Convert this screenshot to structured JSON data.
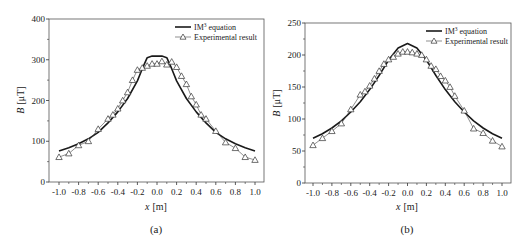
{
  "chart_data": [
    {
      "id": "a",
      "type": "line",
      "caption": "(a)",
      "xlabel": "x [m]",
      "xlabel_var": "x",
      "xlabel_unit": "[m]",
      "ylabel": "B [μT]",
      "ylabel_var": "B",
      "ylabel_unit": "[μT]",
      "xlim": [
        -1.0,
        1.0
      ],
      "ylim": [
        0,
        400
      ],
      "xticks": [
        -1.0,
        -0.8,
        -0.6,
        -0.4,
        -0.2,
        0.0,
        0.2,
        0.4,
        0.6,
        0.8,
        1.0
      ],
      "xtick_labels": [
        "-1.0",
        "-0.8",
        "-0.6",
        "-0.4",
        "-0.2",
        "0.0",
        "0.2",
        "0.4",
        "0.6",
        "0.8",
        "1.0"
      ],
      "yticks": [
        0,
        100,
        200,
        300,
        400
      ],
      "ytick_labels": [
        "0",
        "100",
        "200",
        "300",
        "400"
      ],
      "grid": false,
      "legend_position": "top-right",
      "legend": [
        {
          "name": "IM3 equation",
          "main": "IM",
          "sup": "3",
          "rest": " equation",
          "style": "solid-line"
        },
        {
          "name": "Experimental result",
          "main": "Experimental result",
          "style": "line-triangle"
        }
      ],
      "series": [
        {
          "name": "IM3 equation",
          "x": [
            -1.0,
            -0.9,
            -0.8,
            -0.7,
            -0.6,
            -0.5,
            -0.4,
            -0.3,
            -0.2,
            -0.15,
            -0.1,
            -0.05,
            0.0,
            0.05,
            0.1,
            0.15,
            0.2,
            0.3,
            0.4,
            0.5,
            0.6,
            0.7,
            0.8,
            0.9,
            1.0
          ],
          "y": [
            76,
            84,
            94,
            106,
            122,
            145,
            172,
            205,
            248,
            278,
            305,
            309,
            309,
            309,
            305,
            278,
            248,
            205,
            172,
            145,
            122,
            106,
            94,
            84,
            76
          ]
        },
        {
          "name": "Experimental result",
          "x": [
            -1.0,
            -0.9,
            -0.8,
            -0.7,
            -0.6,
            -0.5,
            -0.45,
            -0.4,
            -0.35,
            -0.3,
            -0.25,
            -0.2,
            -0.15,
            -0.1,
            -0.05,
            0.0,
            0.05,
            0.1,
            0.15,
            0.2,
            0.25,
            0.3,
            0.35,
            0.4,
            0.45,
            0.5,
            0.6,
            0.7,
            0.8,
            0.9,
            1.0
          ],
          "y": [
            61,
            70,
            90,
            100,
            130,
            155,
            165,
            180,
            200,
            220,
            250,
            275,
            280,
            285,
            290,
            290,
            296,
            288,
            295,
            282,
            260,
            240,
            210,
            190,
            165,
            155,
            125,
            97,
            83,
            61,
            54
          ]
        }
      ]
    },
    {
      "id": "b",
      "type": "line",
      "caption": "(b)",
      "xlabel": "x [m]",
      "xlabel_var": "x",
      "xlabel_unit": "[m]",
      "ylabel": "B [μT]",
      "ylabel_var": "B",
      "ylabel_unit": "[μT]",
      "xlim": [
        -1.0,
        1.0
      ],
      "ylim": [
        0,
        250
      ],
      "xticks": [
        -1.0,
        -0.8,
        -0.6,
        -0.4,
        -0.2,
        0.0,
        0.2,
        0.4,
        0.6,
        0.8,
        1.0
      ],
      "xtick_labels": [
        "-1.0",
        "-0.8",
        "-0.6",
        "-0.4",
        "-0.2",
        "0.0",
        "0.2",
        "0.4",
        "0.6",
        "0.8",
        "1.0"
      ],
      "yticks": [
        0,
        50,
        100,
        150,
        200,
        250
      ],
      "ytick_labels": [
        "0",
        "50",
        "100",
        "150",
        "200",
        "250"
      ],
      "grid": false,
      "legend_position": "top-right",
      "legend": [
        {
          "name": "IM3 equation",
          "main": "IM",
          "sup": "3",
          "rest": " equation",
          "style": "solid-line"
        },
        {
          "name": "Experimental result",
          "main": "Experimental result",
          "style": "line-triangle"
        }
      ],
      "series": [
        {
          "name": "IM3 equation",
          "x": [
            -1.0,
            -0.9,
            -0.8,
            -0.7,
            -0.6,
            -0.5,
            -0.4,
            -0.3,
            -0.2,
            -0.1,
            0.0,
            0.1,
            0.2,
            0.3,
            0.4,
            0.5,
            0.6,
            0.7,
            0.8,
            0.9,
            1.0
          ],
          "y": [
            70,
            77,
            86,
            97,
            111,
            127,
            146,
            168,
            192,
            211,
            218,
            211,
            192,
            168,
            146,
            127,
            111,
            97,
            86,
            77,
            70
          ]
        },
        {
          "name": "Experimental result",
          "x": [
            -1.0,
            -0.9,
            -0.8,
            -0.7,
            -0.6,
            -0.5,
            -0.45,
            -0.4,
            -0.35,
            -0.3,
            -0.25,
            -0.2,
            -0.15,
            -0.1,
            -0.05,
            0.0,
            0.05,
            0.1,
            0.15,
            0.2,
            0.25,
            0.3,
            0.35,
            0.4,
            0.45,
            0.5,
            0.6,
            0.7,
            0.8,
            0.9,
            1.0
          ],
          "y": [
            59,
            70,
            81,
            93,
            115,
            138,
            143,
            152,
            163,
            175,
            186,
            193,
            197,
            202,
            205,
            205,
            204,
            202,
            200,
            193,
            183,
            178,
            167,
            160,
            150,
            136,
            113,
            85,
            78,
            66,
            57
          ]
        }
      ]
    }
  ]
}
